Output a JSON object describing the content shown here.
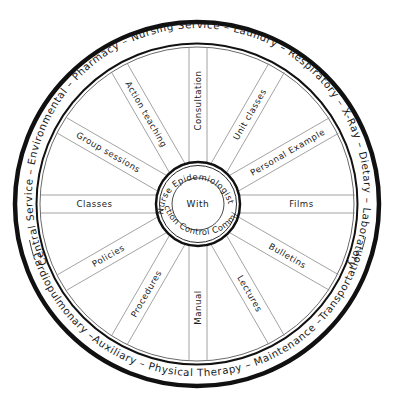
{
  "diagram": {
    "center": {
      "label": "With"
    },
    "hub": {
      "top_arc": "Nurse Epidemiologist",
      "bottom_arc": "Infection Control Committee"
    },
    "spokes": [
      {
        "label": "Consultation",
        "angle": 0
      },
      {
        "label": "Unit classes",
        "angle": 30
      },
      {
        "label": "Personal Example",
        "angle": 60
      },
      {
        "label": "Films",
        "angle": 90
      },
      {
        "label": "Bulletins",
        "angle": 120
      },
      {
        "label": "Lectures",
        "angle": 150
      },
      {
        "label": "Manual",
        "angle": 180
      },
      {
        "label": "Procedures",
        "angle": 210
      },
      {
        "label": "Policies",
        "angle": 240
      },
      {
        "label": "Classes",
        "angle": 270
      },
      {
        "label": "Group sessions",
        "angle": 300
      },
      {
        "label": "Action teaching",
        "angle": 330
      }
    ],
    "rim": {
      "upper_text": "Central Service – Environmental – Pharmacy – Nursing Service – Laundry – Respiratory – X-Ray – Dietary – Laboratory",
      "lower_text": "Cardiopulmonary –Auxiliary – Physical Therapy – Maintenance –Transportation",
      "departments_upper": [
        "Central Service",
        "Environmental",
        "Pharmacy",
        "Nursing Service",
        "Laundry",
        "Respiratory",
        "X-Ray",
        "Dietary",
        "Laboratory"
      ],
      "departments_lower": [
        "Cardiopulmonary",
        "Auxiliary",
        "Physical Therapy",
        "Maintenance",
        "Transportation"
      ]
    },
    "colors": {
      "ink": "#1a1a1a",
      "line": "#8c8c8c",
      "background": "#ffffff"
    }
  }
}
